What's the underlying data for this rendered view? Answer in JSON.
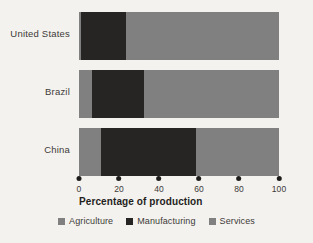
{
  "chart_data": {
    "type": "bar",
    "orientation": "horizontal",
    "stacked": true,
    "title": "",
    "xlabel": "Percentage of production",
    "ylabel": "",
    "xlim": [
      0,
      100
    ],
    "xticks": [
      "0",
      "20",
      "40",
      "60",
      "80",
      "100"
    ],
    "xtick_values": [
      0,
      20,
      40,
      60,
      80,
      100
    ],
    "grid": false,
    "legend_position": "bottom",
    "categories": [
      "United States",
      "Brazil",
      "China"
    ],
    "series": [
      {
        "name": "Agriculture",
        "color": "#808080",
        "values": [
          1,
          6.5,
          11
        ]
      },
      {
        "name": "Manufacturing",
        "color": "#262524",
        "values": [
          22.5,
          26,
          47.5
        ]
      },
      {
        "name": "Services",
        "color": "#808080",
        "values": [
          76.5,
          67.5,
          41.5
        ]
      }
    ]
  },
  "colors": {
    "background": "#f4f2ee",
    "agriculture": "#808080",
    "manufacturing": "#262524",
    "services": "#808080",
    "text": "#3c3a38",
    "tick_dot": "#1d1c1b"
  }
}
